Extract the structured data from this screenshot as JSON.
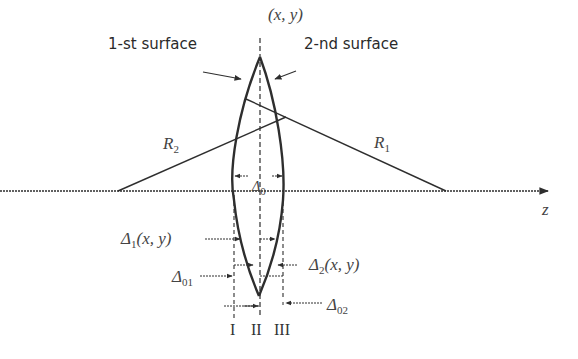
{
  "diagram": {
    "title_point": "(x, y)",
    "surface1_label": "1-st surface",
    "surface2_label": "2-nd surface",
    "radius2_label": "R",
    "radius2_sub": "2",
    "radius1_label": "R",
    "radius1_sub": "1",
    "center_thickness_label": "Δ",
    "center_thickness_sub": "0",
    "axis_label": "z",
    "delta1_label": "Δ",
    "delta1_sub": "1",
    "delta1_args": "(x, y)",
    "delta2_label": "Δ",
    "delta2_sub": "2",
    "delta2_args": "(x, y)",
    "delta01_label": "Δ",
    "delta01_sub": "01",
    "delta02_label": "Δ",
    "delta02_sub": "02",
    "planes": [
      "I",
      "II",
      "III"
    ],
    "colors": {
      "line": "#2e2e2e",
      "background": "#ffffff"
    }
  }
}
